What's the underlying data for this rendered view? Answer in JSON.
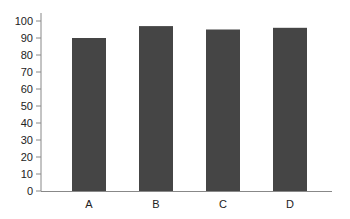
{
  "chart_data": {
    "type": "bar",
    "title": "",
    "xlabel": "",
    "ylabel": "",
    "categories": [
      "A",
      "B",
      "C",
      "D"
    ],
    "values": [
      90,
      97,
      95,
      96
    ],
    "ylim": [
      0,
      100
    ],
    "yticks": [
      0,
      10,
      20,
      30,
      40,
      50,
      60,
      70,
      80,
      90,
      100
    ],
    "grid": false,
    "legend": null,
    "bar_color": "#454545",
    "axis_color": "#888888"
  }
}
